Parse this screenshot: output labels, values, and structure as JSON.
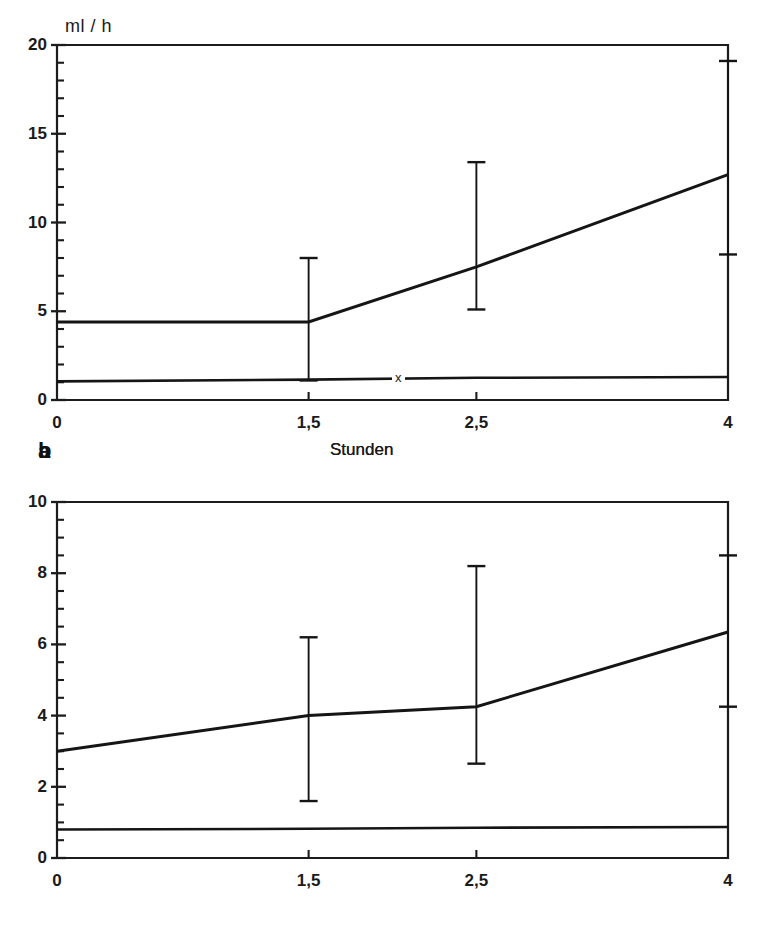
{
  "figure": {
    "background": "#ffffff",
    "ink_color": "#151515",
    "panel_count": 2
  },
  "chart_data": [
    {
      "type": "line",
      "panel_label": "a",
      "title": "",
      "xlabel": "Stunden",
      "ylabel": "ml / h",
      "unit_label": "ml / h",
      "xlim": [
        0,
        4
      ],
      "ylim": [
        0,
        20
      ],
      "grid": false,
      "legend": "none",
      "x_tick_labels": [
        "0",
        "1,5",
        "2,5",
        "4"
      ],
      "x_tick_values": [
        0,
        1.5,
        2.5,
        4
      ],
      "y_tick_labels": [
        "0",
        "5",
        "10",
        "15",
        "20"
      ],
      "y_tick_values": [
        0,
        5,
        10,
        15,
        20
      ],
      "y_minor_step": 1,
      "x": [
        0,
        1.5,
        2.5,
        4
      ],
      "series": [
        {
          "name": "upper",
          "values": [
            4.4,
            4.4,
            7.5,
            12.7
          ],
          "errors_low": [
            null,
            1.1,
            5.1,
            8.2
          ],
          "errors_high": [
            null,
            8.0,
            13.4,
            19.1
          ]
        },
        {
          "name": "lower",
          "values": [
            1.05,
            1.15,
            1.25,
            1.3
          ],
          "errors_low": [
            null,
            null,
            null,
            null
          ],
          "errors_high": [
            null,
            null,
            null,
            null
          ]
        }
      ],
      "annotations": [
        {
          "text": "x",
          "x": 1.98,
          "series": "lower"
        }
      ]
    },
    {
      "type": "line",
      "panel_label": "b",
      "title": "",
      "xlabel": "Stunden",
      "ylabel": "",
      "unit_label": "",
      "xlim": [
        0,
        4
      ],
      "ylim": [
        0,
        10
      ],
      "grid": false,
      "legend": "none",
      "x_tick_labels": [
        "0",
        "1,5",
        "2,5",
        "4"
      ],
      "x_tick_values": [
        0,
        1.5,
        2.5,
        4
      ],
      "y_tick_labels": [
        "0",
        "2",
        "4",
        "6",
        "8",
        "10"
      ],
      "y_tick_values": [
        0,
        2,
        4,
        6,
        8,
        10
      ],
      "y_minor_step": 0.5,
      "x": [
        0,
        1.5,
        2.5,
        4
      ],
      "series": [
        {
          "name": "upper",
          "values": [
            3.0,
            4.0,
            4.25,
            6.35
          ],
          "errors_low": [
            null,
            1.6,
            2.65,
            4.25
          ],
          "errors_high": [
            null,
            6.2,
            8.2,
            8.5
          ]
        },
        {
          "name": "lower",
          "values": [
            0.8,
            0.82,
            0.85,
            0.87
          ],
          "errors_low": [
            null,
            null,
            null,
            null
          ],
          "errors_high": [
            null,
            null,
            null,
            null
          ]
        }
      ],
      "annotations": [
        {
          "text": "x",
          "x": 1.98,
          "series": "lower"
        }
      ]
    }
  ],
  "panel_a": {
    "tag": "a",
    "unit_label": "ml / h",
    "axis_title": "Stunden",
    "y_labels": [
      "20",
      "15",
      "10",
      "5",
      "0"
    ],
    "x_labels": [
      "0",
      "1,5",
      "2,5",
      "4"
    ],
    "marker": "x"
  },
  "panel_b": {
    "tag": "b",
    "unit_label": "",
    "axis_title": "Stunden",
    "y_labels": [
      "10",
      "8",
      "6",
      "4",
      "2",
      "0"
    ],
    "x_labels": [
      "0",
      "1,5",
      "2,5",
      "4"
    ],
    "marker": "x"
  }
}
